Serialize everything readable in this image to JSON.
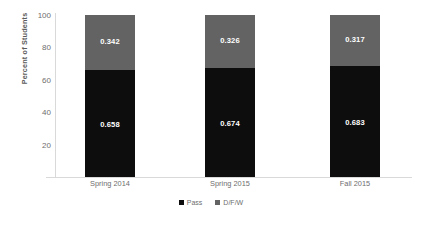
{
  "chart_data": {
    "type": "bar",
    "subtype": "stacked-100-percent",
    "title": "",
    "xlabel": "",
    "ylabel": "Percent of Students",
    "ylim": [
      0,
      100
    ],
    "yticks": [
      20,
      40,
      60,
      80,
      100
    ],
    "grid": false,
    "legend_position": "bottom-center",
    "categories": [
      "Spring 2014",
      "Spring 2015",
      "Fall 2015"
    ],
    "series": [
      {
        "name": "Pass",
        "color": "#0d0d0d",
        "values": [
          0.658,
          0.674,
          0.683
        ],
        "labels": [
          "0.658",
          "0.674",
          "0.683"
        ]
      },
      {
        "name": "D/F/W",
        "color": "#636363",
        "values": [
          0.342,
          0.326,
          0.317
        ],
        "labels": [
          "0.342",
          "0.326",
          "0.317"
        ]
      }
    ]
  },
  "axis": {
    "y_title": "Percent of Students",
    "y_tick_labels": [
      "100",
      "80",
      "60",
      "40",
      "20"
    ]
  },
  "legend": {
    "items": [
      {
        "label": "Pass",
        "color": "#0d0d0d"
      },
      {
        "label": "D/F/W",
        "color": "#636363"
      }
    ]
  },
  "colors": {
    "pass": "#0d0d0d",
    "dfw": "#636363",
    "axis": "#d9d9d9",
    "text": "#6e6e6e",
    "background": "#ffffff"
  }
}
